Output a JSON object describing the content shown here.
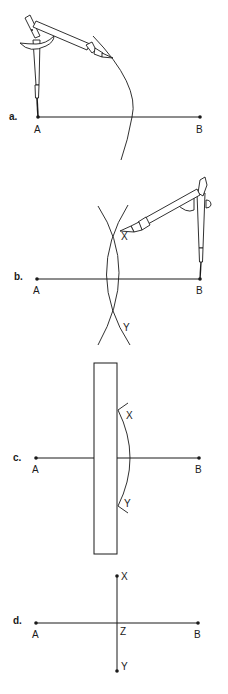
{
  "figure": {
    "colors": {
      "ink": "#1a1a1a",
      "background": "#ffffff"
    },
    "steps": [
      {
        "id": "a",
        "label": "a.",
        "points": {
          "A": "A",
          "B": "B"
        },
        "description": "Compass centered at A, arc drawn beyond midpoint of AB"
      },
      {
        "id": "b",
        "label": "b.",
        "points": {
          "A": "A",
          "B": "B",
          "X": "X",
          "Y": "Y"
        },
        "description": "Compass centered at B, second arc crosses first at X and Y"
      },
      {
        "id": "c",
        "label": "c.",
        "points": {
          "A": "A",
          "B": "B",
          "X": "X",
          "Y": "Y"
        },
        "description": "Ruler placed to join X and Y"
      },
      {
        "id": "d",
        "label": "d.",
        "points": {
          "A": "A",
          "B": "B",
          "X": "X",
          "Y": "Y",
          "Z": "Z"
        },
        "description": "Line XY is the perpendicular bisector of AB, meeting it at Z"
      }
    ]
  }
}
